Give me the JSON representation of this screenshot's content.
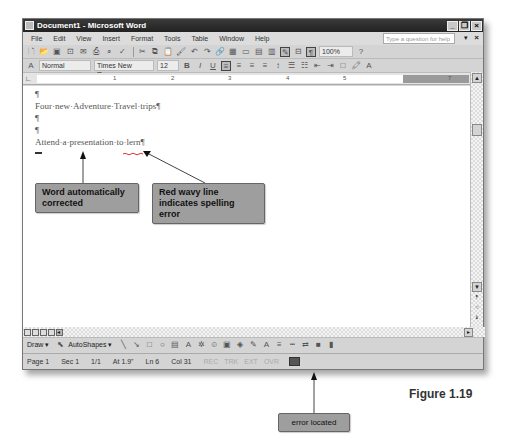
{
  "window": {
    "title": "Document1 - Microsoft Word"
  },
  "menubar": {
    "items": [
      "File",
      "Edit",
      "View",
      "Insert",
      "Format",
      "Tools",
      "Table",
      "Window",
      "Help"
    ],
    "help_placeholder": "Type a question for help"
  },
  "formatting": {
    "style": "Normal",
    "font": "Times New Roman",
    "size": "12",
    "zoom": "100%"
  },
  "ruler": {
    "marks": [
      "1",
      "2",
      "3",
      "4",
      "5",
      "7"
    ]
  },
  "document": {
    "lines": [
      "¶",
      "Four·new·Adventure·Travel·trips¶",
      "¶",
      "¶",
      "Attend·a·presentation·to·lern¶"
    ]
  },
  "draw_toolbar": {
    "draw_label": "Draw ▾",
    "autoshapes_label": "AutoShapes ▾"
  },
  "statusbar": {
    "page": "Page 1",
    "sec": "Sec 1",
    "pages": "1/1",
    "at": "At 1.9\"",
    "ln": "Ln 6",
    "col": "Col 31",
    "rec": "REC",
    "trk": "TRK",
    "ext": "EXT",
    "ovr": "OVR"
  },
  "callouts": {
    "autocorrect": "Word automatically corrected",
    "spelling": "Red wavy line indicates spelling error",
    "error_located": "error located"
  },
  "figure_label": "Figure 1.19"
}
